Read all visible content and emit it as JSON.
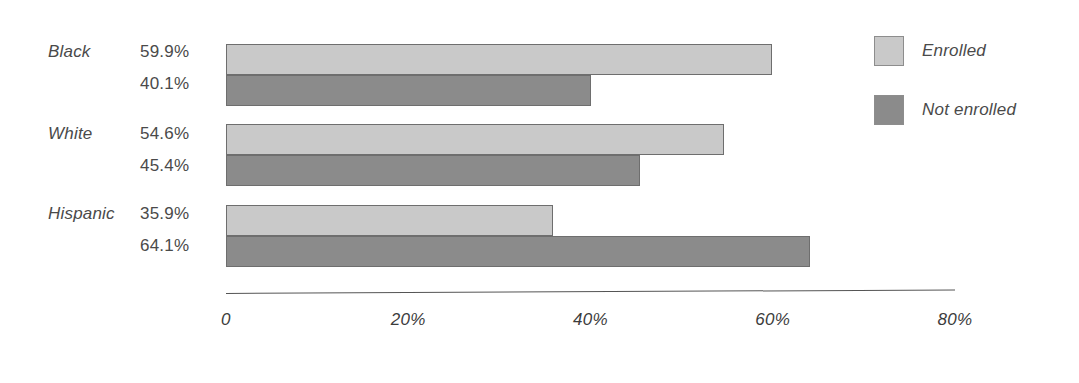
{
  "chart_data": {
    "type": "bar",
    "orientation": "horizontal",
    "title": "",
    "xlabel": "",
    "ylabel": "",
    "categories": [
      "Black",
      "White",
      "Hispanic"
    ],
    "series": [
      {
        "name": "Enrolled",
        "color": "#c9c9c9",
        "values": [
          59.9,
          54.6,
          35.9
        ],
        "value_labels": [
          "59.9%",
          "40.1%",
          "54.6%"
        ]
      },
      {
        "name": "Not enrolled",
        "color": "#8b8b8b",
        "values": [
          40.1,
          45.4,
          64.1
        ],
        "value_labels": [
          "40.1%",
          "45.4%",
          "64.1%"
        ]
      }
    ],
    "groups": [
      {
        "category": "Black",
        "enrolled": 59.9,
        "enrolled_label": "59.9%",
        "not_enrolled": 40.1,
        "not_enrolled_label": "40.1%"
      },
      {
        "category": "White",
        "enrolled": 54.6,
        "enrolled_label": "54.6%",
        "not_enrolled": 45.4,
        "not_enrolled_label": "45.4%"
      },
      {
        "category": "Hispanic",
        "enrolled": 35.9,
        "enrolled_label": "35.9%",
        "not_enrolled": 64.1,
        "not_enrolled_label": "64.1%"
      }
    ],
    "xticks": [
      0,
      20,
      40,
      60,
      80
    ],
    "xtick_labels": [
      "0",
      "20%",
      "40%",
      "60%",
      "80%"
    ],
    "xlim": [
      0,
      80
    ],
    "grid": false,
    "legend_position": "right",
    "legend": [
      {
        "label": "Enrolled",
        "color": "#c9c9c9"
      },
      {
        "label": "Not enrolled",
        "color": "#8b8b8b"
      }
    ]
  },
  "labels": {
    "cat_0": "Black",
    "cat_1": "White",
    "cat_2": "Hispanic",
    "val_0_enrolled": "59.9%",
    "val_0_not": "40.1%",
    "val_1_enrolled": "54.6%",
    "val_1_not": "45.4%",
    "val_2_enrolled": "35.9%",
    "val_2_not": "64.1%"
  },
  "axis": {
    "tick_0": "0",
    "tick_1": "20%",
    "tick_2": "40%",
    "tick_3": "60%",
    "tick_4": "80%"
  },
  "legend": {
    "enrolled": "Enrolled",
    "not_enrolled": "Not enrolled"
  },
  "colors": {
    "enrolled": "#c9c9c9",
    "not_enrolled": "#8b8b8b",
    "bar_border": "#6e6e6e",
    "axis": "#555555",
    "text": "#4a4a4a",
    "background": "#ffffff"
  }
}
